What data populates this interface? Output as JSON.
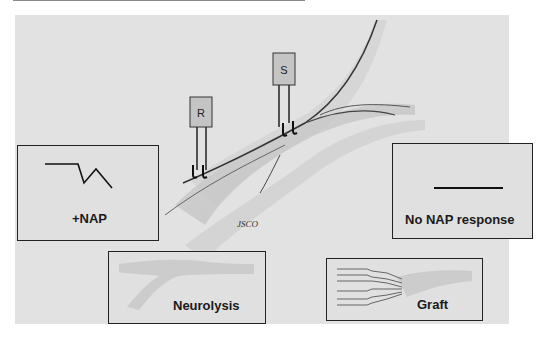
{
  "figure": {
    "electrodes": {
      "recording": "R",
      "stimulating": "S"
    },
    "signature": "JSCO"
  },
  "boxes": {
    "positive_nap": {
      "label": "+NAP",
      "trace": "action-potential-waveform"
    },
    "no_nap": {
      "label": "No NAP response",
      "trace": "flat-line"
    },
    "neurolysis": {
      "label": "Neurolysis",
      "image": "intact-nerve-branch"
    },
    "graft": {
      "label": "Graft",
      "image": "nerve-cable-grafts"
    }
  }
}
